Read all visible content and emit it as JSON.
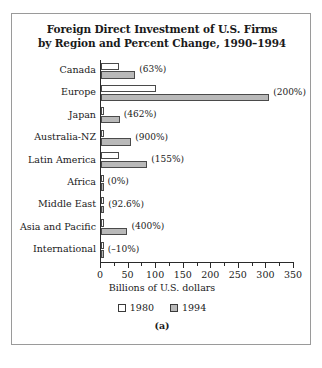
{
  "figure": {
    "caption": "(a)",
    "border_color": "#9a9a9a"
  },
  "chart_data": {
    "type": "bar",
    "orientation": "horizontal",
    "title": "Foreign Direct Investment of U.S. Firms by Region and Percent Change, 1990–1994",
    "title_line1": "Foreign Direct Investment of U.S. Firms",
    "title_line2": "by Region and Percent Change, 1990–1994",
    "xlabel": "Billions of U.S. dollars",
    "ylabel": "",
    "xlim": [
      0,
      350
    ],
    "xticks": [
      0,
      50,
      100,
      150,
      200,
      250,
      300,
      350
    ],
    "xtick_labels": [
      "0",
      "50",
      "100",
      "150",
      "200",
      "250",
      "300",
      "350"
    ],
    "minor_tick_step": 25,
    "grid": false,
    "legend_position": "bottom",
    "categories": [
      "Canada",
      "Europe",
      "Japan",
      "Australia-NZ",
      "Latin America",
      "Africa",
      "Middle East",
      "Asia and Pacific",
      "International"
    ],
    "series": [
      {
        "name": "1980",
        "color": "#ffffff",
        "values": [
          33,
          100,
          6,
          5,
          33,
          3,
          6,
          4,
          5
        ]
      },
      {
        "name": "1994",
        "color": "#b9b9b9",
        "values": [
          62,
          305,
          34,
          55,
          84,
          3,
          6,
          48,
          5
        ]
      }
    ],
    "annotations": [
      "(63%)",
      "(200%)",
      "(462%)",
      "(900%)",
      "(155%)",
      "(0%)",
      "(92.6%)",
      "(400%)",
      "(–10%)"
    ]
  }
}
